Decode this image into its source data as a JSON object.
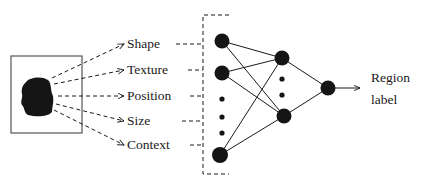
{
  "diagram": {
    "features": [
      {
        "label": "Shape"
      },
      {
        "label": "Texture"
      },
      {
        "label": "Position"
      },
      {
        "label": "Size"
      },
      {
        "label": "Context"
      }
    ],
    "output": {
      "line1": "Region",
      "line2": "label"
    },
    "network": {
      "input_nodes_visible": 3,
      "hidden_nodes_visible": 2,
      "output_nodes": 1
    },
    "colors": {
      "ink": "#1a1a1a",
      "background": "#ffffff"
    }
  }
}
